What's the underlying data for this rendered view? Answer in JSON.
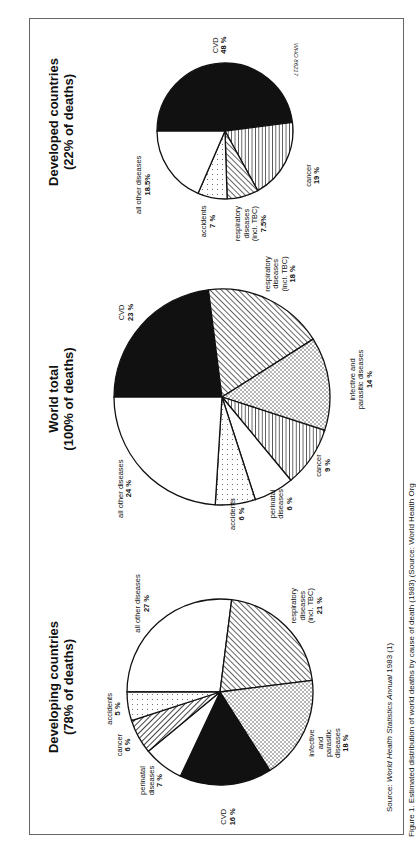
{
  "figure": {
    "source_prefix": "Source: ",
    "source_title": "World Health Statistics Annual",
    "source_suffix": " 1983 (1)",
    "code": "WHO 86217",
    "caption": "Figure 1. Estimated distribution of world deaths by cause of death (1983) (Source: World Health Org"
  },
  "chart_data": [
    {
      "type": "pie",
      "title": "Developing countries",
      "subtitle": "(78% of deaths)",
      "start": "12 o'clock, clockwise",
      "slices": [
        {
          "key": "other",
          "label": [
            "all other diseases"
          ],
          "pct_label": "27 %",
          "value": 27,
          "fill": "white"
        },
        {
          "key": "resp",
          "label": [
            "respiratory",
            "diseases",
            "(incl. TBC)"
          ],
          "pct_label": "21 %",
          "value": 21,
          "fill": "diag"
        },
        {
          "key": "inf",
          "label": [
            "infective",
            "and",
            "parasitic",
            "diseases"
          ],
          "pct_label": "18 %",
          "value": 18,
          "fill": "cross"
        },
        {
          "key": "cvd",
          "label": [
            "CVD"
          ],
          "pct_label": "16 %",
          "value": 16,
          "fill": "black"
        },
        {
          "key": "peri",
          "label": [
            "perinatal",
            "diseases"
          ],
          "pct_label": "7 %",
          "value": 7,
          "fill": "white"
        },
        {
          "key": "cancer",
          "label": [
            "cancer"
          ],
          "pct_label": "6 %",
          "value": 6,
          "fill": "diag2"
        },
        {
          "key": "acc",
          "label": [
            "accidents"
          ],
          "pct_label": "5 %",
          "value": 5,
          "fill": "dots"
        }
      ]
    },
    {
      "type": "pie",
      "title": "World total",
      "subtitle": "(100% of deaths)",
      "start": "12 o'clock, clockwise",
      "slices": [
        {
          "key": "cvd",
          "label": [
            "CVD"
          ],
          "pct_label": "23 %",
          "value": 23,
          "fill": "black"
        },
        {
          "key": "resp",
          "label": [
            "respiratory",
            "diseases",
            "(incl. TBC)"
          ],
          "pct_label": "18 %",
          "value": 18,
          "fill": "diag"
        },
        {
          "key": "inf",
          "label": [
            "infective and",
            "parasitic diseases"
          ],
          "pct_label": "14 %",
          "value": 14,
          "fill": "cross"
        },
        {
          "key": "cancer",
          "label": [
            "cancer"
          ],
          "pct_label": "9 %",
          "value": 9,
          "fill": "hstripe"
        },
        {
          "key": "peri",
          "label": [
            "perinatal",
            "diseases"
          ],
          "pct_label": "6 %",
          "value": 6,
          "fill": "white"
        },
        {
          "key": "acc",
          "label": [
            "accidents"
          ],
          "pct_label": "6 %",
          "value": 6,
          "fill": "dots"
        },
        {
          "key": "other",
          "label": [
            "all other diseases"
          ],
          "pct_label": "24 %",
          "value": 24,
          "fill": "white"
        }
      ]
    },
    {
      "type": "pie",
      "title": "Developed countries",
      "subtitle": "(22% of deaths)",
      "start": "12 o'clock, clockwise",
      "slices": [
        {
          "key": "cvd",
          "label": [
            "CVD"
          ],
          "pct_label": "48 %",
          "value": 48,
          "fill": "black"
        },
        {
          "key": "cancer",
          "label": [
            "cancer"
          ],
          "pct_label": "19 %",
          "value": 19,
          "fill": "hstripe"
        },
        {
          "key": "resp",
          "label": [
            "respiratory",
            "diseases",
            "(incl. TBC)"
          ],
          "pct_label": "7.5%",
          "value": 7.5,
          "fill": "diag"
        },
        {
          "key": "acc",
          "label": [
            "accidents"
          ],
          "pct_label": "7 %",
          "value": 7,
          "fill": "dots"
        },
        {
          "key": "other",
          "label": [
            "all other diseases"
          ],
          "pct_label": "18.5%",
          "value": 18.5,
          "fill": "white"
        }
      ]
    }
  ]
}
